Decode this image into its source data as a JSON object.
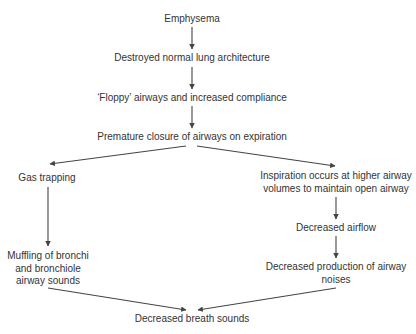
{
  "diagram": {
    "type": "flowchart",
    "colors": {
      "text": "#333333",
      "arrow": "#444444",
      "background": "#ffffff"
    },
    "nodes": {
      "emphysema": {
        "lines": [
          "Emphysema"
        ]
      },
      "destroyed": {
        "lines": [
          "Destroyed normal lung architecture"
        ]
      },
      "floppy": {
        "lines": [
          "‘Floppy’ airways and increased compliance"
        ]
      },
      "premature": {
        "lines": [
          "Premature closure of airways on expiration"
        ]
      },
      "gas_trapping": {
        "lines": [
          "Gas trapping"
        ]
      },
      "inspiration": {
        "lines": [
          "Inspiration occurs at higher airway",
          "volumes to maintain open airway"
        ]
      },
      "decreased_airflow": {
        "lines": [
          "Decreased airflow"
        ]
      },
      "muffling": {
        "lines": [
          "Muffling of bronchi",
          "and bronchiole",
          "airway sounds"
        ]
      },
      "decreased_production": {
        "lines": [
          "Decreased production of airway",
          "noises"
        ]
      },
      "decreased_breath": {
        "lines": [
          "Decreased breath sounds"
        ]
      }
    },
    "edges": [
      [
        "emphysema",
        "destroyed"
      ],
      [
        "destroyed",
        "floppy"
      ],
      [
        "floppy",
        "premature"
      ],
      [
        "premature",
        "gas_trapping"
      ],
      [
        "premature",
        "inspiration"
      ],
      [
        "gas_trapping",
        "muffling"
      ],
      [
        "inspiration",
        "decreased_airflow"
      ],
      [
        "decreased_airflow",
        "decreased_production"
      ],
      [
        "muffling",
        "decreased_breath"
      ],
      [
        "decreased_production",
        "decreased_breath"
      ]
    ]
  }
}
